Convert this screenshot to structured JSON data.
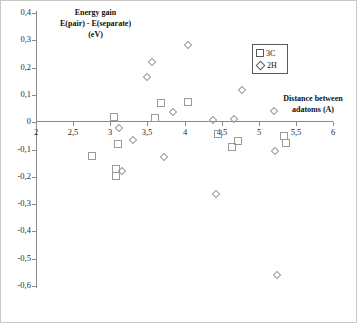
{
  "chart_data": {
    "type": "scatter",
    "title_lines": [
      "Energy gain",
      "E(pair) - E(separate)",
      "(eV)"
    ],
    "xlabel": "Distance between adatoms (A)",
    "xlabel_lines": [
      "Distance between",
      "adatoms (A)"
    ],
    "ylabel": "Energy gain E(pair) - E(separate) (eV)",
    "xlim": [
      2,
      6
    ],
    "ylim": [
      -0.6,
      0.4
    ],
    "grid": false,
    "legend_position": "top-right",
    "decimal_separator": ",",
    "xticks": [
      "2",
      "2,5",
      "3",
      "3,5",
      "4",
      "4,5",
      "5",
      "5,5",
      "6"
    ],
    "xtick_values": [
      2,
      2.5,
      3,
      3.5,
      4,
      4.5,
      5,
      5.5,
      6
    ],
    "yticks": [
      "0,4",
      "0,3",
      "0,2",
      "0,1",
      "0",
      "-0,1",
      "-0,2",
      "-0,3",
      "-0,4",
      "-0,5",
      "-0,6"
    ],
    "ytick_values": [
      0.4,
      0.3,
      0.2,
      0.1,
      0,
      -0.1,
      -0.2,
      -0.3,
      -0.4,
      -0.5,
      -0.6
    ],
    "series": [
      {
        "name": "3C",
        "marker": "square",
        "color": "#9a9a9a",
        "points": [
          [
            2.75,
            -0.122
          ],
          [
            3.05,
            0.02
          ],
          [
            3.1,
            -0.08
          ],
          [
            3.08,
            -0.17
          ],
          [
            3.08,
            -0.196
          ],
          [
            3.6,
            0.015
          ],
          [
            3.68,
            0.07
          ],
          [
            4.05,
            0.076
          ],
          [
            4.45,
            -0.042
          ],
          [
            4.64,
            -0.09
          ],
          [
            4.72,
            -0.068
          ],
          [
            5.34,
            -0.05
          ],
          [
            5.36,
            -0.076
          ]
        ]
      },
      {
        "name": "2H",
        "marker": "diamond",
        "color": "#9a9a9a",
        "points": [
          [
            3.12,
            -0.02
          ],
          [
            3.3,
            -0.065
          ],
          [
            3.16,
            -0.178
          ],
          [
            3.5,
            0.165
          ],
          [
            3.56,
            0.219
          ],
          [
            3.72,
            -0.126
          ],
          [
            3.85,
            0.039
          ],
          [
            4.04,
            0.283
          ],
          [
            4.38,
            0.008
          ],
          [
            4.42,
            -0.263
          ],
          [
            4.67,
            0.012
          ],
          [
            4.78,
            0.118
          ],
          [
            5.2,
            0.042
          ],
          [
            5.22,
            -0.107
          ],
          [
            5.25,
            -0.558
          ]
        ]
      }
    ]
  }
}
